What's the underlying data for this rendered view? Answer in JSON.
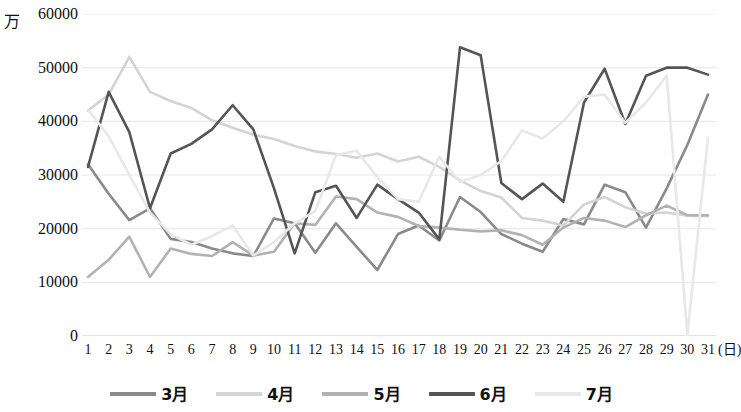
{
  "chart_data": {
    "type": "line",
    "title": "",
    "subtitle": "",
    "unit_label": "万",
    "xlabel": "(日)",
    "ylabel": "",
    "ylim": [
      0,
      60000
    ],
    "ytick_values": [
      60000,
      50000,
      40000,
      30000,
      20000,
      10000,
      0
    ],
    "ytick_labels": [
      "60000",
      "50000",
      "40000",
      "30000",
      "20000",
      "10000",
      "0"
    ],
    "grid": true,
    "legend_position": "bottom",
    "x": [
      1,
      2,
      3,
      4,
      5,
      6,
      7,
      8,
      9,
      10,
      11,
      12,
      13,
      14,
      15,
      16,
      17,
      18,
      19,
      20,
      21,
      22,
      23,
      24,
      25,
      26,
      27,
      28,
      29,
      30,
      31
    ],
    "xtick_labels": [
      "1",
      "2",
      "3",
      "4",
      "5",
      "6",
      "7",
      "8",
      "9",
      "10",
      "11",
      "12",
      "13",
      "14",
      "15",
      "16",
      "17",
      "18",
      "19",
      "20",
      "21",
      "22",
      "23",
      "24",
      "25",
      "26",
      "27",
      "28",
      "29",
      "30",
      "31"
    ],
    "series": [
      {
        "name": "3月",
        "color": "#8a8a8a",
        "values": [
          32000,
          26500,
          21600,
          23800,
          18100,
          17500,
          16300,
          15400,
          14900,
          21900,
          21000,
          15500,
          21000,
          16600,
          12300,
          19000,
          20600,
          17800,
          25900,
          23100,
          19000,
          17200,
          15700,
          21800,
          20800,
          28200,
          26800,
          20200,
          27500,
          35600,
          45000
        ]
      },
      {
        "name": "4月",
        "color": "#d4d4d4",
        "values": [
          42000,
          45000,
          52000,
          45500,
          43800,
          42500,
          40200,
          38800,
          37500,
          36700,
          35400,
          34400,
          33900,
          33200,
          34000,
          32500,
          33400,
          31500,
          29000,
          27000,
          25800,
          22000,
          21500,
          20600,
          24500,
          25900,
          24000,
          22800,
          23000,
          22400,
          22300
        ]
      },
      {
        "name": "5月",
        "color": "#b2b2b2",
        "values": [
          11000,
          14200,
          18500,
          11000,
          16300,
          15300,
          14900,
          17500,
          15000,
          15700,
          21000,
          20700,
          26000,
          25500,
          23000,
          22200,
          20500,
          20200,
          19800,
          19500,
          19700,
          18800,
          17000,
          20200,
          22000,
          21500,
          20300,
          22500,
          24300,
          22500,
          22500
        ]
      },
      {
        "name": "6月",
        "color": "#555555",
        "values": [
          31500,
          45500,
          38000,
          23800,
          34000,
          35800,
          38500,
          43000,
          38500,
          27500,
          15400,
          26800,
          28000,
          22000,
          28200,
          25500,
          23000,
          18000,
          53800,
          52300,
          28500,
          25500,
          28400,
          25000,
          43500,
          49800,
          39500,
          48500,
          50000,
          50000,
          48700
        ]
      },
      {
        "name": "7月",
        "color": "#e8e8e8",
        "values": [
          42200,
          37200,
          30000,
          23000,
          19000,
          17000,
          18600,
          20600,
          15000,
          17500,
          21000,
          23300,
          33700,
          34500,
          29600,
          25500,
          25000,
          33400,
          28700,
          30000,
          32600,
          38300,
          36800,
          40000,
          44600,
          45000,
          39700,
          43500,
          48500,
          200,
          37000
        ]
      }
    ]
  },
  "axis": {
    "y_unit_prefix": "万"
  },
  "legend": {
    "items": [
      {
        "label": "3月",
        "color": "#8a8a8a"
      },
      {
        "label": "4月",
        "color": "#d4d4d4"
      },
      {
        "label": "5月",
        "color": "#b2b2b2"
      },
      {
        "label": "6月",
        "color": "#555555"
      },
      {
        "label": "7月",
        "color": "#e8e8e8"
      }
    ]
  }
}
